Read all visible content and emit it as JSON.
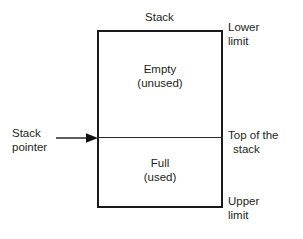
{
  "diagram": {
    "title": "Stack",
    "box": {
      "upper_region": {
        "line1": "Empty",
        "line2": "(unused)"
      },
      "lower_region": {
        "line1": "Full",
        "line2": "(used)"
      }
    },
    "right_annotations": [
      {
        "name": "lower-limit",
        "line1": "Lower",
        "line2": "limit"
      },
      {
        "name": "top-of-stack",
        "line1": "Top of the",
        "line2": "stack"
      },
      {
        "name": "upper-limit",
        "line1": "Upper",
        "line2": "limit"
      }
    ],
    "left_annotation": {
      "line1": "Stack",
      "line2": "pointer"
    },
    "colors": {
      "background": "#ffffff",
      "border": "#1a1a1a",
      "divider": "#2a2a2a",
      "text": "#231f20"
    }
  }
}
